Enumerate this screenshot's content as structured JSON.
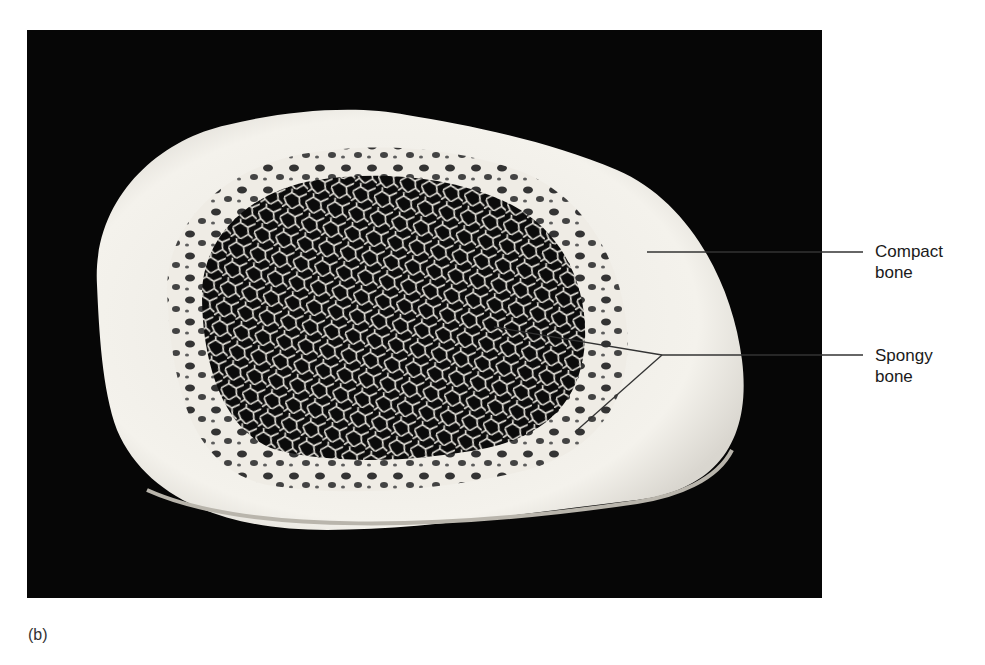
{
  "figure": {
    "panel_label": "(b)",
    "background_color": "#060606",
    "bone_color": "#f2f0ea"
  },
  "labels": [
    {
      "id": "compact",
      "line1": "Compact",
      "line2": "bone"
    },
    {
      "id": "spongy",
      "line1": "Spongy",
      "line2": "bone"
    }
  ]
}
